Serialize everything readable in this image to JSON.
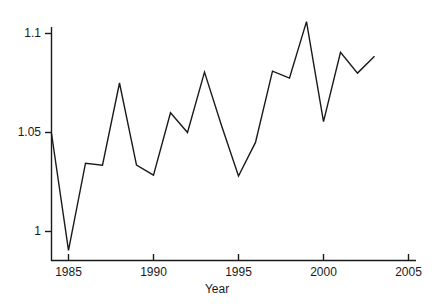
{
  "chart_data": {
    "type": "line",
    "title": "",
    "xlabel": "Year",
    "ylabel": "",
    "grid": false,
    "legend": "none",
    "xlim": [
      1983.0,
      2006.2
    ],
    "ylim": [
      0.9855,
      1.1085
    ],
    "xticks": [
      1985,
      1990,
      1995,
      2000,
      2005
    ],
    "xtick_labels": [
      "1985",
      "1990",
      "1995",
      "2000",
      "2005"
    ],
    "yticks": [
      1,
      1.05,
      1.1
    ],
    "ytick_labels": [
      "1",
      "1.05",
      "1.1"
    ],
    "line_color": "#1a1a1a",
    "x": [
      1984,
      1985,
      1986,
      1987,
      1988,
      1989,
      1990,
      1991,
      1992,
      1993,
      1994,
      1995,
      1996,
      1997,
      1998,
      1999,
      2000,
      2001,
      2002,
      2003
    ],
    "values": [
      1.0495,
      0.9905,
      1.0345,
      1.0335,
      1.075,
      1.0335,
      1.0285,
      1.06,
      1.05,
      1.0805,
      1.0535,
      1.028,
      1.045,
      1.081,
      1.0775,
      1.106,
      1.0555,
      1.0905,
      1.08,
      1.0885
    ],
    "series": [
      {
        "name": "value",
        "values": [
          1.0495,
          0.9905,
          1.0345,
          1.0335,
          1.075,
          1.0335,
          1.0285,
          1.06,
          1.05,
          1.0805,
          1.0535,
          1.028,
          1.045,
          1.081,
          1.0775,
          1.106,
          1.0555,
          1.0905,
          1.08,
          1.0885
        ]
      }
    ]
  },
  "axes": {
    "x_title": "Year",
    "y_tick_texts": [
      "1.1",
      "1.05",
      "1"
    ],
    "x_tick_texts": [
      "1985",
      "1990",
      "1995",
      "2000",
      "2005"
    ]
  }
}
